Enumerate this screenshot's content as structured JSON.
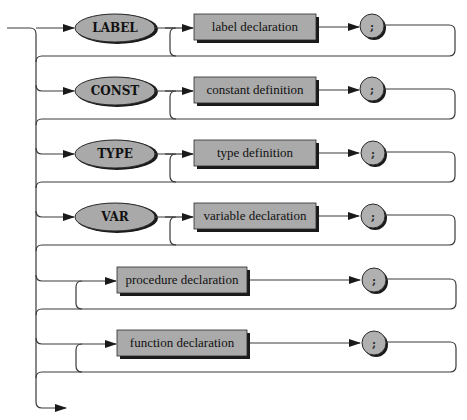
{
  "diagram": {
    "type": "syntax-diagram",
    "rows": [
      {
        "keyword": "LABEL",
        "nonterminal": "label declaration",
        "terminator": ";"
      },
      {
        "keyword": "CONST",
        "nonterminal": "constant definition",
        "terminator": ";"
      },
      {
        "keyword": "TYPE",
        "nonterminal": "type definition",
        "terminator": ";"
      },
      {
        "keyword": "VAR",
        "nonterminal": "variable declaration",
        "terminator": ";"
      },
      {
        "keyword": "",
        "nonterminal": "procedure declaration",
        "terminator": ";"
      },
      {
        "keyword": "",
        "nonterminal": "function declaration",
        "terminator": ";"
      }
    ],
    "colors": {
      "node_fill": "#aaaaaa",
      "stroke": "#2a2a2a",
      "shadow": "#1a1a1a"
    }
  }
}
